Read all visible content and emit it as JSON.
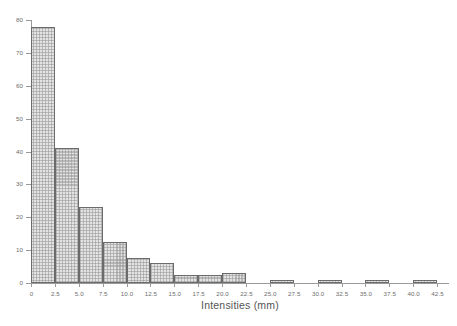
{
  "chart_data": {
    "type": "bar",
    "title": "",
    "subtitle": "",
    "xlabel": "Intensities (mm)",
    "ylabel": "",
    "xlim": [
      0,
      43.75
    ],
    "ylim": [
      0,
      80
    ],
    "grid": false,
    "legend": null,
    "bin_width": 2.5,
    "bin_edges": [
      0,
      2.5,
      5.0,
      7.5,
      10.0,
      12.5,
      15.0,
      17.5,
      20.0,
      22.5,
      25.0,
      27.5,
      30.0,
      32.5,
      35.0,
      37.5,
      40.0,
      42.5
    ],
    "categories": [
      "0-2.5",
      "2.5-5.0",
      "5.0-7.5",
      "7.5-10.0",
      "10.0-12.5",
      "12.5-15.0",
      "15.0-17.5",
      "17.5-20.0",
      "20.0-22.5",
      "22.5-25.0",
      "25.0-27.5",
      "27.5-30.0",
      "30.0-32.5",
      "32.5-35.0",
      "35.0-37.5",
      "37.5-40.0",
      "40.0-42.5"
    ],
    "values": [
      78,
      41,
      23,
      12.5,
      7.5,
      6,
      2.5,
      3,
      0,
      1,
      0,
      1,
      0,
      1,
      0,
      1,
      0
    ],
    "bars": [
      {
        "x0": 0.0,
        "x1": 2.5,
        "value": 78
      },
      {
        "x0": 2.5,
        "x1": 5.0,
        "value": 41
      },
      {
        "x0": 5.0,
        "x1": 7.5,
        "value": 23
      },
      {
        "x0": 7.5,
        "x1": 10.0,
        "value": 12.5
      },
      {
        "x0": 10.0,
        "x1": 12.5,
        "value": 7.5
      },
      {
        "x0": 12.5,
        "x1": 15.0,
        "value": 6
      },
      {
        "x0": 15.0,
        "x1": 17.5,
        "value": 2.5
      },
      {
        "x0": 17.5,
        "x1": 20.0,
        "value": 2.5
      },
      {
        "x0": 20.0,
        "x1": 22.5,
        "value": 3
      },
      {
        "x0": 25.0,
        "x1": 27.5,
        "value": 1
      },
      {
        "x0": 30.0,
        "x1": 32.5,
        "value": 1
      },
      {
        "x0": 35.0,
        "x1": 37.5,
        "value": 1
      },
      {
        "x0": 40.0,
        "x1": 42.5,
        "value": 1
      }
    ],
    "y_ticks": [
      0,
      10,
      20,
      30,
      40,
      50,
      60,
      70,
      80
    ],
    "y_tick_labels": [
      "0",
      "10",
      "20",
      "30",
      "40",
      "50",
      "60",
      "70",
      "80"
    ],
    "x_ticks": [
      0,
      2.5,
      5.0,
      7.5,
      10.0,
      12.5,
      15.0,
      17.5,
      20.0,
      22.5,
      25.0,
      27.5,
      30.0,
      32.5,
      35.0,
      37.5,
      40.0,
      42.5
    ],
    "x_tick_labels": [
      "0",
      "2.5",
      "5.0",
      "7.5",
      "10.0",
      "12.5",
      "15.0",
      "17.5",
      "20.0",
      "22.5",
      "25.0",
      "27.5",
      "30.0",
      "32.5",
      "35.0",
      "37.5",
      "40.0",
      "42.5"
    ],
    "colors": {
      "bar_fill": "#e3e3e3",
      "bar_edge": "#6b6b6b",
      "axis": "#9a9a9a",
      "text": "#6d6d6d",
      "background": "#ffffff"
    }
  }
}
